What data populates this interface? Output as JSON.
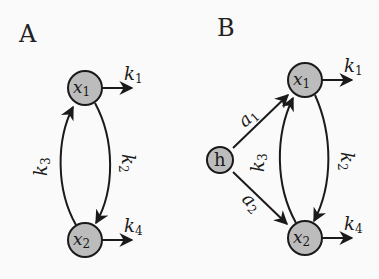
{
  "panels": {
    "A": {
      "label": "A",
      "nodes": {
        "x1": {
          "base": "x",
          "sub": "1"
        },
        "x2": {
          "base": "x",
          "sub": "2"
        }
      },
      "rates": {
        "k1": {
          "base": "k",
          "sub": "1"
        },
        "k2": {
          "base": "k",
          "sub": "2"
        },
        "k3": {
          "base": "k",
          "sub": "3"
        },
        "k4": {
          "base": "k",
          "sub": "4"
        }
      }
    },
    "B": {
      "label": "B",
      "nodes": {
        "x1": {
          "base": "x",
          "sub": "1"
        },
        "x2": {
          "base": "x",
          "sub": "2"
        },
        "h": {
          "label": "h"
        }
      },
      "rates": {
        "k1": {
          "base": "k",
          "sub": "1"
        },
        "k2": {
          "base": "k",
          "sub": "2"
        },
        "k3": {
          "base": "k",
          "sub": "3"
        },
        "k4": {
          "base": "k",
          "sub": "4"
        },
        "a1": {
          "base": "a",
          "sub": "1"
        },
        "a2": {
          "base": "a",
          "sub": "2"
        }
      }
    }
  },
  "colors": {
    "node_fill": "#bcbcbc",
    "stroke": "#1a1a1a",
    "background": "#fafafa"
  }
}
